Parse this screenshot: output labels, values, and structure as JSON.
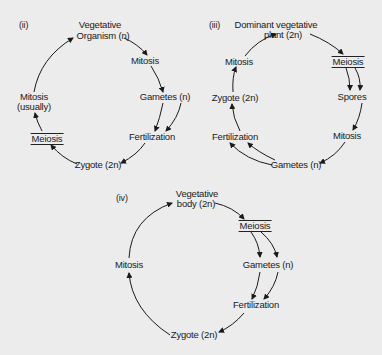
{
  "figure": {
    "background_color": "#ececec",
    "ink_color": "#1a1a1a"
  },
  "diagrams": {
    "ii": {
      "tag": "(ii)",
      "nodes": {
        "vegetative_line1": "Vegetative",
        "vegetative_line2": "Organism (n)",
        "mitosis": "Mitosis",
        "gametes": "Gametes (n)",
        "fertilization": "Fertilization",
        "zygote": "Zygote (2n)",
        "meiosis": "Meiosis",
        "mitosis_usually_line1": "Mitosis",
        "mitosis_usually_line2": "(usually)"
      }
    },
    "iii": {
      "tag": "(iii)",
      "nodes": {
        "dominant_line1": "Dominant vegetative",
        "dominant_line2": "plant (2n)",
        "meiosis": "Meiosis",
        "spores": "Spores",
        "mitosis_right": "Mitosis",
        "gametes": "Gametes (n)",
        "fertilization": "Fertilization",
        "zygote": "Zygote (2n)",
        "mitosis_left": "Mitosis"
      }
    },
    "iv": {
      "tag": "(iv)",
      "nodes": {
        "vegetative_line1": "Vegetative",
        "vegetative_line2": "body (2n)",
        "meiosis": "Meiosis",
        "gametes": "Gametes (n)",
        "fertilization": "Fertilization",
        "zygote": "Zygote (2n)",
        "mitosis": "Mitosis"
      }
    }
  }
}
